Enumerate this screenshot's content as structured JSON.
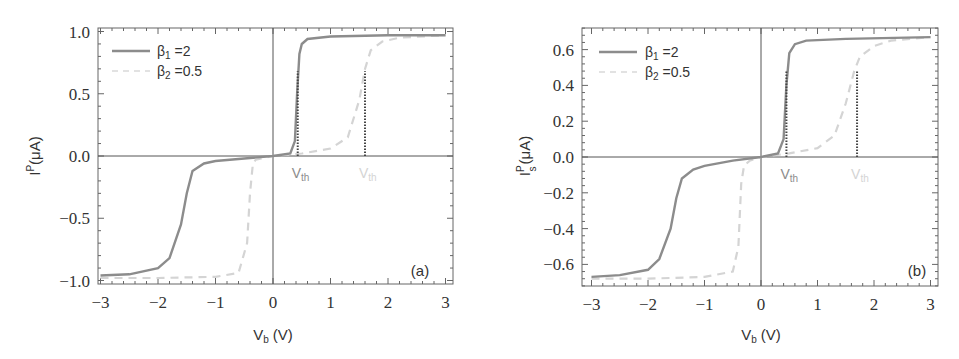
{
  "chart_data": [
    {
      "panel": "(a)",
      "type": "line",
      "title": "",
      "xlabel": "V_b (V)",
      "ylabel": "I^P (μA)",
      "xlim": [
        -3.1,
        3.1
      ],
      "ylim": [
        -1.03,
        1.03
      ],
      "xticks": [
        -3,
        -2,
        -1,
        0,
        1,
        2,
        3
      ],
      "xtick_labels": [
        "−3",
        "−2",
        "−1",
        "0",
        "1",
        "2",
        "3"
      ],
      "yticks": [
        1.0,
        0.5,
        0.0,
        -0.5,
        -1.0
      ],
      "ytick_labels": [
        "1.0",
        "0.5",
        "0.0",
        "−0.5",
        "−1.0"
      ],
      "grid": false,
      "legend_position": "upper left",
      "series": [
        {
          "name": "β1 =2",
          "style": "solid",
          "color": "#8c8c8c",
          "x": [
            -3.0,
            -2.5,
            -2.0,
            -1.8,
            -1.6,
            -1.5,
            -1.4,
            -1.2,
            -1.0,
            -0.5,
            0.0,
            0.3,
            0.38,
            0.42,
            0.46,
            0.5,
            0.6,
            1.0,
            2.0,
            3.0
          ],
          "y": [
            -0.96,
            -0.95,
            -0.9,
            -0.82,
            -0.55,
            -0.3,
            -0.12,
            -0.06,
            -0.04,
            -0.02,
            0.0,
            0.02,
            0.12,
            0.5,
            0.82,
            0.9,
            0.94,
            0.96,
            0.97,
            0.97
          ]
        },
        {
          "name": "β2 =0.5",
          "style": "dashed",
          "color": "#d4d4d4",
          "x": [
            -3.0,
            -2.0,
            -1.0,
            -0.6,
            -0.45,
            -0.4,
            -0.35,
            -0.3,
            -0.2,
            0.0,
            0.5,
            1.0,
            1.3,
            1.5,
            1.6,
            1.7,
            1.9,
            2.2,
            3.0
          ],
          "y": [
            -0.98,
            -0.98,
            -0.97,
            -0.94,
            -0.7,
            -0.3,
            -0.06,
            -0.03,
            -0.02,
            0.0,
            0.02,
            0.06,
            0.15,
            0.45,
            0.7,
            0.85,
            0.92,
            0.95,
            0.97
          ]
        }
      ],
      "annotations": [
        {
          "text": "V_th",
          "x": 0.43,
          "color": "#8c8c8c",
          "marker_line_ymax": 0.68
        },
        {
          "text": "V_th",
          "x": 1.6,
          "color": "#d4d4d4",
          "marker_line_ymax": 0.68
        }
      ]
    },
    {
      "panel": "(b)",
      "type": "line",
      "title": "",
      "xlabel": "V_b (V)",
      "ylabel": "I_s^P (μA)",
      "xlim": [
        -3.1,
        3.1
      ],
      "ylim": [
        -0.72,
        0.72
      ],
      "xticks": [
        -3,
        -2,
        -1,
        0,
        1,
        2,
        3
      ],
      "xtick_labels": [
        "−3",
        "−2",
        "−1",
        "0",
        "1",
        "2",
        "3"
      ],
      "yticks": [
        0.6,
        0.4,
        0.2,
        0.0,
        -0.2,
        -0.4,
        -0.6
      ],
      "ytick_labels": [
        "0.6",
        "0.4",
        "0.2",
        "0.0",
        "−0.2",
        "−0.4",
        "−0.6"
      ],
      "grid": false,
      "legend_position": "upper left",
      "series": [
        {
          "name": "β1 =2",
          "style": "solid",
          "color": "#8c8c8c",
          "x": [
            -3.0,
            -2.5,
            -2.0,
            -1.8,
            -1.6,
            -1.5,
            -1.4,
            -1.2,
            -1.0,
            -0.5,
            0.0,
            0.3,
            0.4,
            0.45,
            0.5,
            0.6,
            0.8,
            1.5,
            3.0
          ],
          "y": [
            -0.67,
            -0.66,
            -0.63,
            -0.57,
            -0.4,
            -0.23,
            -0.12,
            -0.07,
            -0.05,
            -0.02,
            0.0,
            0.02,
            0.1,
            0.4,
            0.58,
            0.63,
            0.65,
            0.66,
            0.67
          ]
        },
        {
          "name": "β2 =0.5",
          "style": "dashed",
          "color": "#d4d4d4",
          "x": [
            -3.0,
            -2.0,
            -1.0,
            -0.5,
            -0.4,
            -0.35,
            -0.3,
            -0.2,
            0.0,
            0.5,
            1.0,
            1.3,
            1.5,
            1.65,
            1.75,
            2.0,
            2.3,
            3.0
          ],
          "y": [
            -0.68,
            -0.68,
            -0.67,
            -0.64,
            -0.5,
            -0.15,
            -0.05,
            -0.02,
            0.0,
            0.02,
            0.05,
            0.12,
            0.3,
            0.48,
            0.56,
            0.62,
            0.65,
            0.67
          ]
        }
      ],
      "annotations": [
        {
          "text": "V_th",
          "x": 0.45,
          "color": "#8c8c8c",
          "marker_line_ymax": 0.48
        },
        {
          "text": "V_th",
          "x": 1.7,
          "color": "#d4d4d4",
          "marker_line_ymax": 0.48
        }
      ]
    }
  ],
  "labels": {
    "panel_a": {
      "tag": "(a)",
      "ylabel_main": "I",
      "ylabel_sup": "P",
      "ylabel_sub": "",
      "ylabel_unit": "(μA)",
      "xlabel_main": "V",
      "xlabel_sub": "b",
      "xlabel_unit": " (V)",
      "legend": [
        {
          "beta": "β",
          "sub": "1",
          "value": " =2"
        },
        {
          "beta": "β",
          "sub": "2",
          "value": " =0.5"
        }
      ],
      "vth_main": "V",
      "vth_sub": "th"
    },
    "panel_b": {
      "tag": "(b)",
      "ylabel_main": "I",
      "ylabel_sup": "P",
      "ylabel_sub": "s",
      "ylabel_unit": "(μA)",
      "xlabel_main": "V",
      "xlabel_sub": "b",
      "xlabel_unit": " (V)",
      "legend": [
        {
          "beta": "β",
          "sub": "1",
          "value": " =2"
        },
        {
          "beta": "β",
          "sub": "2",
          "value": " =0.5"
        }
      ],
      "vth_main": "V",
      "vth_sub": "th"
    }
  },
  "colors": {
    "series1": "#8c8c8c",
    "series2": "#d4d4d4",
    "axis": "#555555",
    "marker": "#444444"
  }
}
